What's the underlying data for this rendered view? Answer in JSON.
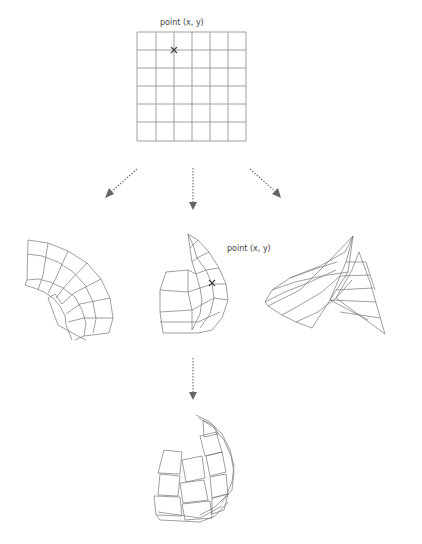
{
  "diagram": {
    "top_label": "point (x, y)",
    "middle_label": "point (x, y)",
    "source_grid": {
      "rows": 6,
      "cols": 6,
      "marker": "x-mark"
    },
    "colors": {
      "line": "#777777",
      "arrow": "#666666",
      "text": "#444444",
      "background": "#ffffff"
    },
    "nodes": [
      {
        "id": "flat-grid",
        "description": "flat 6x6 parameter grid with marked point"
      },
      {
        "id": "bent-tube",
        "description": "grid deformed into curved tube segment"
      },
      {
        "id": "dome-surface",
        "description": "grid deformed into dome with mapped point"
      },
      {
        "id": "saddle-surface",
        "description": "grid deformed into twisted saddle"
      },
      {
        "id": "tiled-shell",
        "description": "shell assembled from offset panel tiles"
      }
    ],
    "edges": [
      {
        "from": "flat-grid",
        "to": "bent-tube",
        "style": "dotted-arrow"
      },
      {
        "from": "flat-grid",
        "to": "dome-surface",
        "style": "dotted-arrow"
      },
      {
        "from": "flat-grid",
        "to": "saddle-surface",
        "style": "dotted-arrow"
      },
      {
        "from": "dome-surface",
        "to": "tiled-shell",
        "style": "dotted-arrow"
      }
    ]
  }
}
